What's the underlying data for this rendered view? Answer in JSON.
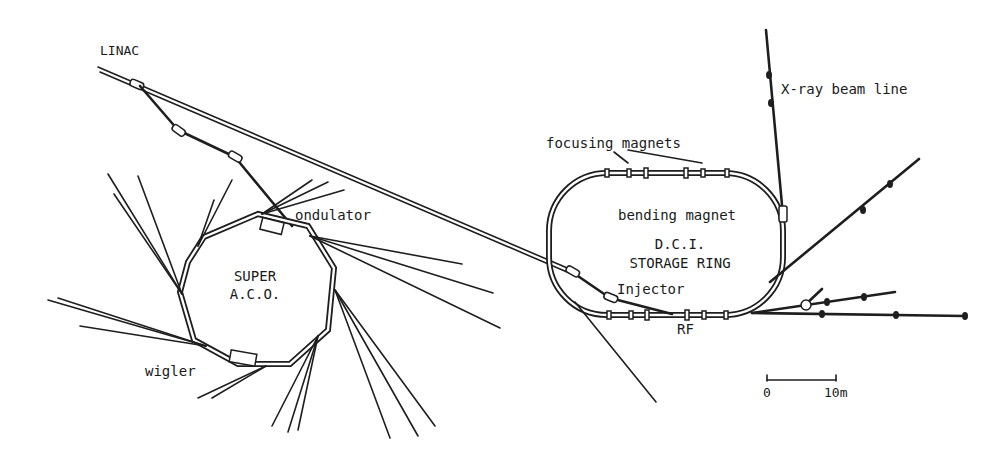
{
  "diagram": {
    "colors": {
      "ink": "#1e1e1e",
      "background": "#ffffff"
    },
    "labels": {
      "linac": "LINAC",
      "xray_beam_line": "X-ray beam line",
      "focusing_magnets": "focusing magnets",
      "bending_magnet": "bending magnet",
      "ondulator": "ondulator",
      "dci_line1": "D.C.I.",
      "dci_line2": "STORAGE RING",
      "injector": "Injector",
      "rf": "RF",
      "super_aco_line1": "SUPER",
      "super_aco_line2": "A.C.O.",
      "wigler": "wigler"
    },
    "scale_bar": {
      "start_label": "0",
      "end_label": "10m",
      "length_m": 10
    },
    "components": [
      {
        "name": "LINAC",
        "type": "linear accelerator"
      },
      {
        "name": "SUPER A.C.O.",
        "type": "storage ring",
        "insertion_devices": [
          "ondulator",
          "wigler"
        ]
      },
      {
        "name": "D.C.I. STORAGE RING",
        "type": "storage ring",
        "parts": [
          "focusing magnets",
          "bending magnet",
          "Injector",
          "RF"
        ]
      },
      {
        "name": "X-ray beam line",
        "type": "beam line"
      }
    ]
  }
}
